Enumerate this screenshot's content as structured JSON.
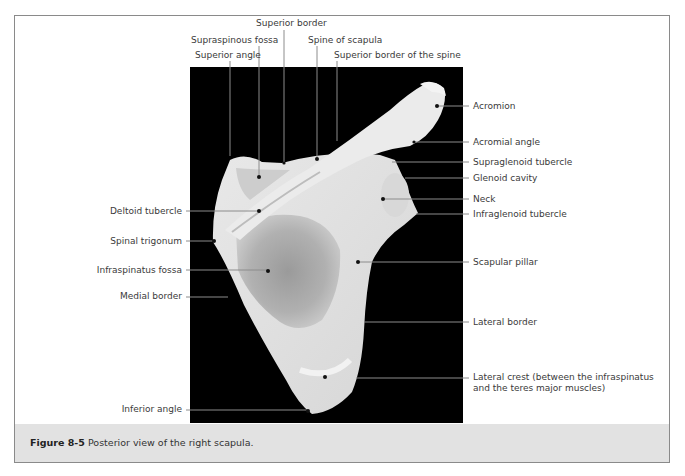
{
  "figure": {
    "number": "Figure 8-5",
    "caption": "Posterior view of the right scapula."
  },
  "labels": {
    "top": [
      {
        "id": "superior-border",
        "text": "Superior border",
        "x": 256,
        "y": 18
      },
      {
        "id": "supraspinous-fossa",
        "text": "Supraspinous fossa",
        "x": 191,
        "y": 35
      },
      {
        "id": "spine-of-scapula",
        "text": "Spine of scapula",
        "x": 308,
        "y": 35
      },
      {
        "id": "superior-angle",
        "text": "Superior angle",
        "x": 195,
        "y": 50
      },
      {
        "id": "superior-border-of-spine",
        "text": "Superior border of the spine",
        "x": 334,
        "y": 50
      }
    ],
    "right": [
      {
        "id": "acromion",
        "text": "Acromion",
        "y": 100
      },
      {
        "id": "acromial-angle",
        "text": "Acromial angle",
        "y": 137
      },
      {
        "id": "supraglenoid-tubercle",
        "text": "Supraglenoid tubercle",
        "y": 157
      },
      {
        "id": "glenoid-cavity",
        "text": "Glenoid cavity",
        "y": 174
      },
      {
        "id": "neck",
        "text": "Neck",
        "y": 194
      },
      {
        "id": "infraglenoid-tubercle",
        "text": "Infraglenoid tubercle",
        "y": 209
      },
      {
        "id": "scapular-pillar",
        "text": "Scapular pillar",
        "y": 257
      },
      {
        "id": "lateral-border",
        "text": "Lateral border",
        "y": 317
      },
      {
        "id": "lateral-crest",
        "text": "Lateral crest (between the infraspinatus",
        "text2": "and the teres major muscles)",
        "y": 372
      }
    ],
    "left": [
      {
        "id": "deltoid-tubercle",
        "text": "Deltoid tubercle",
        "y": 206
      },
      {
        "id": "spinal-trigonum",
        "text": "Spinal trigonum",
        "y": 236
      },
      {
        "id": "infraspinatus-fossa",
        "text": "Infraspinatus fossa",
        "y": 265
      },
      {
        "id": "medial-border",
        "text": "Medial border",
        "y": 291
      },
      {
        "id": "inferior-angle",
        "text": "Inferior angle",
        "y": 404
      }
    ]
  }
}
